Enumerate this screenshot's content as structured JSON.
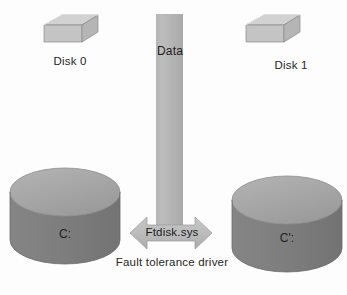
{
  "diagram": {
    "colors": {
      "bar_gray": "#b6b6b6",
      "arrow_gray": "#bdbdbd",
      "cylinder_body": "#808080",
      "cylinder_top": "#a8a8a8",
      "icon_box": "#c9c9c9",
      "icon_platter": "#6e6e6e",
      "text": "#262626",
      "background": "#fdfdfd"
    },
    "data_bar": {
      "label": "Data"
    },
    "arrow": {
      "label": "Ftdisk.sys",
      "caption": "Fault tolerance driver",
      "caption_line1": "Fault tolerance",
      "caption_line2": "driver",
      "direction": "double-headed-horizontal"
    },
    "disk_icons": [
      {
        "label": "Disk 0",
        "icon": "disk-pack-icon",
        "position": "top-left"
      },
      {
        "label": "Disk 1",
        "icon": "disk-pack-icon",
        "position": "top-right"
      }
    ],
    "volumes": [
      {
        "label": "C:",
        "icon": "cylinder-icon",
        "position": "bottom-left"
      },
      {
        "label": "C':",
        "icon": "cylinder-icon",
        "position": "bottom-right"
      }
    ]
  }
}
